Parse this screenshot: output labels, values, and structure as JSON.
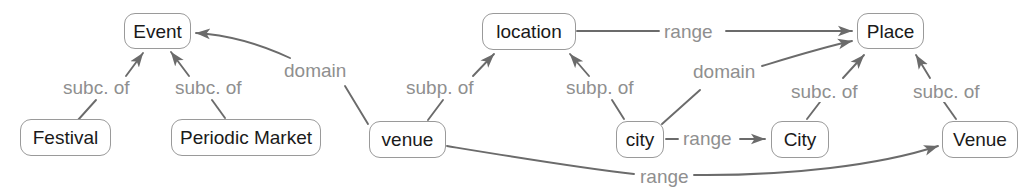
{
  "diagram": {
    "colors": {
      "node_border": "#9a9a9a",
      "node_fill": "#ffffff",
      "node_text": "#1a1a1a",
      "edge_line": "#6b6b6b",
      "edge_label_text": "#8f8f8f",
      "background": "#ffffff"
    },
    "nodes": [
      {
        "id": "event",
        "label": "Event",
        "kind": "class",
        "x": 124,
        "y": 13,
        "w": 67,
        "h": 36
      },
      {
        "id": "festival",
        "label": "Festival",
        "kind": "class",
        "x": 20,
        "y": 119,
        "w": 91,
        "h": 37
      },
      {
        "id": "periodic_market",
        "label": "Periodic Market",
        "kind": "class",
        "x": 171,
        "y": 119,
        "w": 150,
        "h": 37
      },
      {
        "id": "venue_prop",
        "label": "venue",
        "kind": "property",
        "x": 369,
        "y": 121,
        "w": 77,
        "h": 37
      },
      {
        "id": "location_prop",
        "label": "location",
        "kind": "property",
        "x": 482,
        "y": 13,
        "w": 94,
        "h": 37
      },
      {
        "id": "city_prop",
        "label": "city",
        "kind": "property",
        "x": 616,
        "y": 121,
        "w": 48,
        "h": 37
      },
      {
        "id": "city_class",
        "label": "City",
        "kind": "class",
        "x": 771,
        "y": 121,
        "w": 58,
        "h": 37
      },
      {
        "id": "place",
        "label": "Place",
        "kind": "class",
        "x": 857,
        "y": 13,
        "w": 67,
        "h": 36
      },
      {
        "id": "venue_class",
        "label": "Venue",
        "kind": "class",
        "x": 942,
        "y": 121,
        "w": 76,
        "h": 37
      }
    ],
    "edge_labels": [
      {
        "id": "l1",
        "text": "subc. of",
        "x": 60,
        "y": 77
      },
      {
        "id": "l2",
        "text": "subc. of",
        "x": 172,
        "y": 77
      },
      {
        "id": "l3",
        "text": "domain",
        "x": 281,
        "y": 60
      },
      {
        "id": "l4",
        "text": "subp. of",
        "x": 403,
        "y": 77
      },
      {
        "id": "l5",
        "text": "subp. of",
        "x": 563,
        "y": 77
      },
      {
        "id": "l6",
        "text": "range",
        "x": 661,
        "y": 21
      },
      {
        "id": "l7",
        "text": "domain",
        "x": 690,
        "y": 61
      },
      {
        "id": "l8",
        "text": "subc. of",
        "x": 788,
        "y": 81
      },
      {
        "id": "l9",
        "text": "range",
        "x": 680,
        "y": 128
      },
      {
        "id": "l10",
        "text": "subc. of",
        "x": 910,
        "y": 81
      },
      {
        "id": "l11",
        "text": "range",
        "x": 637,
        "y": 166
      }
    ],
    "edges": [
      {
        "id": "e1",
        "from": "festival",
        "to": "event",
        "label": "subc. of",
        "arrow": true
      },
      {
        "id": "e2",
        "from": "periodic_market",
        "to": "event",
        "label": "subc. of",
        "arrow": true
      },
      {
        "id": "e3",
        "from": "venue_prop",
        "to": "event",
        "label": "domain",
        "arrow": true
      },
      {
        "id": "e4",
        "from": "venue_prop",
        "to": "location_prop",
        "label": "subp. of",
        "arrow": true
      },
      {
        "id": "e5",
        "from": "city_prop",
        "to": "location_prop",
        "label": "subp. of",
        "arrow": true
      },
      {
        "id": "e6",
        "from": "location_prop",
        "to": "place",
        "label": "range",
        "arrow": true
      },
      {
        "id": "e7",
        "from": "city_prop",
        "to": "place",
        "label": "domain",
        "arrow": true
      },
      {
        "id": "e8",
        "from": "city_prop",
        "to": "city_class",
        "label": "range",
        "arrow": true
      },
      {
        "id": "e9",
        "from": "city_class",
        "to": "place",
        "label": "subc. of",
        "arrow": true
      },
      {
        "id": "e10",
        "from": "venue_class",
        "to": "place",
        "label": "subc. of",
        "arrow": true
      },
      {
        "id": "e11",
        "from": "venue_prop",
        "to": "venue_class",
        "label": "range",
        "arrow": true
      }
    ]
  }
}
